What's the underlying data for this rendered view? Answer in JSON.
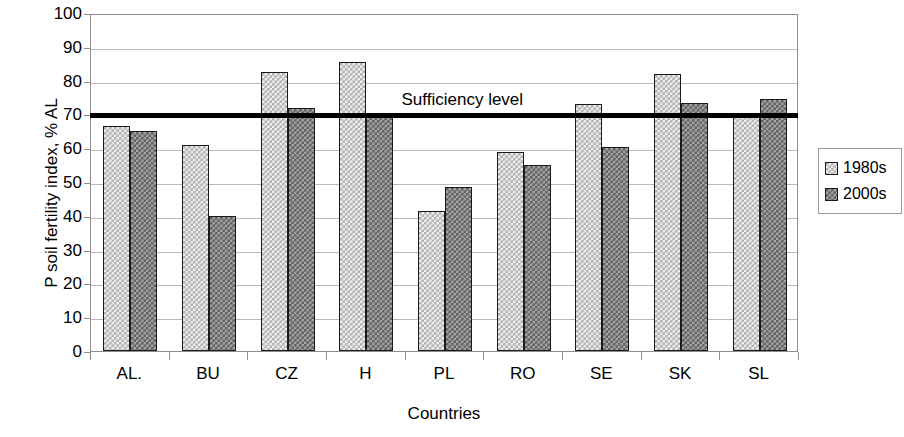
{
  "chart_data": {
    "type": "bar",
    "title": "",
    "xlabel": "Countries",
    "ylabel": "P soil fertility index, % AL",
    "categories": [
      "AL.",
      "BU",
      "CZ",
      "H",
      "PL",
      "RO",
      "SE",
      "SK",
      "SL"
    ],
    "series": [
      {
        "name": "1980s",
        "values": [
          66.5,
          61,
          82.5,
          85.5,
          41.5,
          59,
          73,
          82,
          69.5
        ],
        "color": "#b4b4b4"
      },
      {
        "name": "2000s",
        "values": [
          65,
          40,
          72,
          70,
          48.5,
          55,
          60.5,
          73.5,
          74.5
        ],
        "color": "#646464"
      }
    ],
    "ylim": [
      0,
      100
    ],
    "yticks": [
      0,
      10,
      20,
      30,
      40,
      50,
      60,
      70,
      80,
      90,
      100
    ],
    "ytick_labels": [
      "0",
      "10",
      "20",
      "30",
      "40",
      "50",
      "60",
      "70",
      "80",
      "90",
      "100"
    ],
    "grid": true,
    "legend_position": "right",
    "annotations": [
      {
        "name": "sufficiency-level",
        "label": "Sufficiency level",
        "value": 70,
        "color": "#000000"
      }
    ]
  },
  "legend": {
    "entries": [
      {
        "label": "1980s"
      },
      {
        "label": "2000s"
      }
    ]
  }
}
